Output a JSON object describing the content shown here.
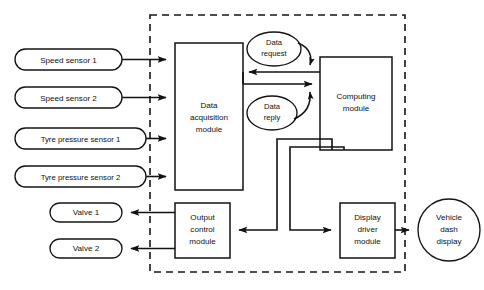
{
  "diagram": {
    "boundary": {
      "name": "system-boundary",
      "style": "dashed"
    },
    "colors": {
      "stroke": "#121212",
      "fill": "#ffffff",
      "background": "#ffffff"
    },
    "inputs": [
      {
        "id": "speed-sensor-1",
        "label": "Speed sensor 1",
        "shape": "rounded-rectangle"
      },
      {
        "id": "speed-sensor-2",
        "label": "Speed sensor 2",
        "shape": "rounded-rectangle"
      },
      {
        "id": "tyre-pressure-sensor-1",
        "label": "Tyre pressure sensor 1",
        "shape": "rounded-rectangle"
      },
      {
        "id": "tyre-pressure-sensor-2",
        "label": "Tyre pressure sensor 2",
        "shape": "rounded-rectangle"
      }
    ],
    "outputs": [
      {
        "id": "valve-1",
        "label": "Valve 1",
        "shape": "rounded-rectangle"
      },
      {
        "id": "valve-2",
        "label": "Valve 2",
        "shape": "rounded-rectangle"
      },
      {
        "id": "vehicle-dash-display",
        "label_line1": "Vehicle",
        "label_line2": "dash",
        "label_line3": "display",
        "shape": "circle"
      }
    ],
    "modules": [
      {
        "id": "data-acquisition-module",
        "label_line1": "Data",
        "label_line2": "acquisition",
        "label_line3": "module",
        "shape": "rectangle"
      },
      {
        "id": "computing-module",
        "label_line1": "Computing",
        "label_line2": "module",
        "shape": "rectangle"
      },
      {
        "id": "output-control-module",
        "label_line1": "Output",
        "label_line2": "control",
        "label_line3": "module",
        "shape": "rectangle"
      },
      {
        "id": "display-driver-module",
        "label_line1": "Display",
        "label_line2": "driver",
        "label_line3": "module",
        "shape": "rectangle"
      }
    ],
    "messages": [
      {
        "id": "data-request",
        "label_line1": "Data",
        "label_line2": "request",
        "shape": "ellipse",
        "direction": "data-acquisition-module-to-computing-module"
      },
      {
        "id": "data-reply",
        "label_line1": "Data",
        "label_line2": "reply",
        "shape": "ellipse",
        "direction": "computing-module-to-data-acquisition-module"
      }
    ],
    "connections": [
      {
        "id": "speed-sensor-1-to-daq",
        "from": "speed-sensor-1",
        "to": "data-acquisition-module"
      },
      {
        "id": "speed-sensor-2-to-daq",
        "from": "speed-sensor-2",
        "to": "data-acquisition-module"
      },
      {
        "id": "tyre-pressure-sensor-1-to-daq",
        "from": "tyre-pressure-sensor-1",
        "to": "data-acquisition-module"
      },
      {
        "id": "tyre-pressure-sensor-2-to-daq",
        "from": "tyre-pressure-sensor-2",
        "to": "data-acquisition-module"
      },
      {
        "id": "computing-to-daq",
        "from": "computing-module",
        "to": "data-acquisition-module"
      },
      {
        "id": "daq-to-computing",
        "from": "data-acquisition-module",
        "to": "computing-module"
      },
      {
        "id": "computing-to-output-control",
        "from": "computing-module",
        "to": "output-control-module"
      },
      {
        "id": "computing-to-display-driver",
        "from": "computing-module",
        "to": "display-driver-module"
      },
      {
        "id": "output-control-to-valve-1",
        "from": "output-control-module",
        "to": "valve-1"
      },
      {
        "id": "output-control-to-valve-2",
        "from": "output-control-module",
        "to": "valve-2"
      },
      {
        "id": "display-driver-to-dash",
        "from": "display-driver-module",
        "to": "vehicle-dash-display"
      }
    ]
  }
}
